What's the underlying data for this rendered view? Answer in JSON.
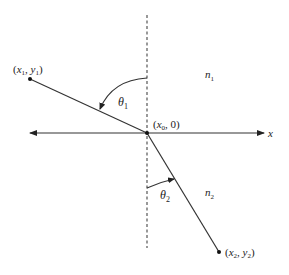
{
  "diagram": {
    "axis_label": "x",
    "origin_label": {
      "main": "(x",
      "sub": "0",
      "rest": ", 0)"
    },
    "point1_label": {
      "x": "x",
      "xsub": "1",
      "y": "y",
      "ysub": "1"
    },
    "point2_label": {
      "x": "x",
      "xsub": "2",
      "y": "y",
      "ysub": "2"
    },
    "theta1": {
      "sym": "θ",
      "sub": "1"
    },
    "theta2": {
      "sym": "θ",
      "sub": "2"
    },
    "n1": {
      "sym": "n",
      "sub": "1"
    },
    "n2": {
      "sym": "n",
      "sub": "2"
    },
    "colors": {
      "line": "#333333",
      "dashed": "#555555",
      "text": "#222222"
    }
  }
}
